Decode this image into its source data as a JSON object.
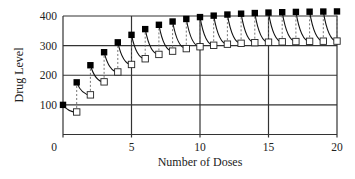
{
  "chart_data": {
    "type": "scatter",
    "title": "",
    "xlabel": "Number of Doses",
    "ylabel": "Drug Level",
    "xlim": [
      0,
      20
    ],
    "ylim": [
      0,
      400
    ],
    "x_ticks": [
      0,
      5,
      10,
      15,
      20
    ],
    "y_ticks": [
      100,
      200,
      300,
      400
    ],
    "x_tick_labels": [
      "0",
      "5",
      "10",
      "15",
      "20"
    ],
    "y_tick_labels": [
      "100",
      "200",
      "300",
      "400"
    ],
    "grid": true,
    "legend": null,
    "model": {
      "dose": 100,
      "retention_fraction": 0.76
    },
    "series": [
      {
        "name": "Level just after dose",
        "marker": "filled-square",
        "x": [
          0,
          1,
          2,
          3,
          4,
          5,
          6,
          7,
          8,
          9,
          10,
          11,
          12,
          13,
          14,
          15,
          16,
          17,
          18,
          19,
          20
        ],
        "values": [
          100,
          176,
          233.8,
          277.7,
          311.1,
          336.4,
          355.7,
          370.3,
          381.4,
          389.9,
          396.3,
          401.2,
          404.9,
          407.8,
          410.0,
          411.6,
          412.8,
          413.8,
          414.5,
          415.0,
          415.4
        ]
      },
      {
        "name": "Level just before dose",
        "marker": "open-square",
        "x": [
          1,
          2,
          3,
          4,
          5,
          6,
          7,
          8,
          9,
          10,
          11,
          12,
          13,
          14,
          15,
          16,
          17,
          18,
          19,
          20
        ],
        "values": [
          76,
          133.8,
          177.7,
          211.1,
          236.4,
          255.7,
          270.3,
          281.4,
          289.9,
          296.3,
          301.2,
          304.9,
          307.8,
          310.0,
          311.6,
          312.8,
          313.8,
          314.5,
          315.0,
          315.3
        ]
      }
    ],
    "connectors": "dotted vertical lines join the open (before) and filled (after) markers at each dose; curved decay lines run from each filled marker to the next open marker"
  }
}
